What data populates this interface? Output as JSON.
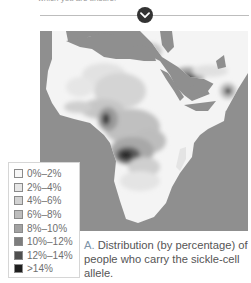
{
  "header": {
    "partial_text": "which you are unsure.",
    "expand_button_icon": "chevron-down-icon"
  },
  "map": {
    "description": "Map of Africa, Middle East and South Asia shaded by percentage of sickle-cell allele carriers",
    "water_color": "#8f8f8f"
  },
  "legend": {
    "items": [
      {
        "label": "0%–2%",
        "color": "#f7f7f7"
      },
      {
        "label": "2%–4%",
        "color": "#e6e6e6"
      },
      {
        "label": "4%–6%",
        "color": "#d2d2d2"
      },
      {
        "label": "6%–8%",
        "color": "#bdbdbd"
      },
      {
        "label": "8%–10%",
        "color": "#a2a2a2"
      },
      {
        "label": "10%–12%",
        "color": "#7d7d7d"
      },
      {
        "label": "12%–14%",
        "color": "#4f4f4f"
      },
      {
        "label": ">14%",
        "color": "#1e1e1e"
      }
    ]
  },
  "caption": {
    "label": "A.",
    "text": " Distribution (by percentage) of people who carry the sickle-cell allele."
  }
}
